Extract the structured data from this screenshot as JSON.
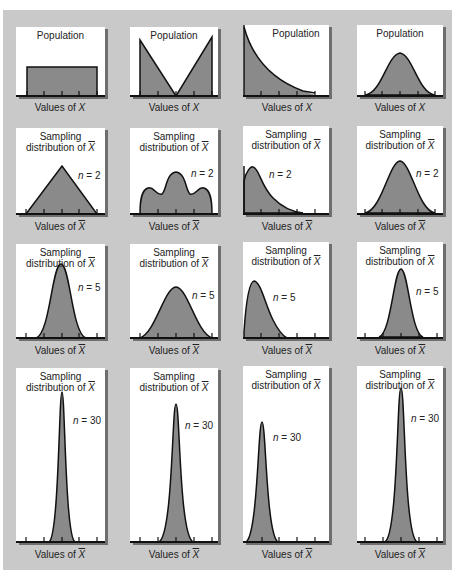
{
  "figure": {
    "columns": [
      "Uniform population",
      "Bimodal (V-shaped) population",
      "Exponential (right-skewed) population",
      "Normal population"
    ],
    "rows": [
      {
        "row": "population",
        "panels": [
          {
            "title": "Population",
            "n_label": "",
            "xlabel_prefix": "Values of ",
            "xlabel_var": "X",
            "shape": "uniform"
          },
          {
            "title": "Population",
            "n_label": "",
            "xlabel_prefix": "Values of ",
            "xlabel_var": "X",
            "shape": "v-shape"
          },
          {
            "title": "Population",
            "n_label": "",
            "xlabel_prefix": "Values of ",
            "xlabel_var": "X",
            "shape": "exponential"
          },
          {
            "title": "Population",
            "n_label": "",
            "xlabel_prefix": "Values of ",
            "xlabel_var": "X",
            "shape": "normal"
          }
        ]
      },
      {
        "row": "n2",
        "panels": [
          {
            "title1": "Sampling",
            "title2": "distribution of ",
            "title_var": "X",
            "n_var": "n",
            "n_val": " = 2",
            "xlabel_prefix": "Values of ",
            "xlabel_var": "X",
            "shape": "triangle"
          },
          {
            "title1": "Sampling",
            "title2": "distribution of ",
            "title_var": "X",
            "n_var": "n",
            "n_val": " = 2",
            "xlabel_prefix": "Values of ",
            "xlabel_var": "X",
            "shape": "trimodal"
          },
          {
            "title1": "Sampling",
            "title2": "distribution of ",
            "title_var": "X",
            "n_var": "n",
            "n_val": " = 2",
            "xlabel_prefix": "Values of ",
            "xlabel_var": "X",
            "shape": "right-skewed"
          },
          {
            "title1": "Sampling",
            "title2": "distribution of ",
            "title_var": "X",
            "n_var": "n",
            "n_val": " = 2",
            "xlabel_prefix": "Values of ",
            "xlabel_var": "X",
            "shape": "normal-narrower"
          }
        ]
      },
      {
        "row": "n5",
        "panels": [
          {
            "title1": "Sampling",
            "title2": "distribution of ",
            "title_var": "X",
            "n_var": "n",
            "n_val": " = 5",
            "xlabel_prefix": "Values of ",
            "xlabel_var": "X",
            "shape": "near-normal"
          },
          {
            "title1": "Sampling",
            "title2": "distribution of ",
            "title_var": "X",
            "n_var": "n",
            "n_val": " = 5",
            "xlabel_prefix": "Values of ",
            "xlabel_var": "X",
            "shape": "near-normal-wide"
          },
          {
            "title1": "Sampling",
            "title2": "distribution of ",
            "title_var": "X",
            "n_var": "n",
            "n_val": " = 5",
            "xlabel_prefix": "Values of ",
            "xlabel_var": "X",
            "shape": "right-skewed-less"
          },
          {
            "title1": "Sampling",
            "title2": "distribution of ",
            "title_var": "X",
            "n_var": "n",
            "n_val": " = 5",
            "xlabel_prefix": "Values of ",
            "xlabel_var": "X",
            "shape": "normal-narrow"
          }
        ]
      },
      {
        "row": "n30",
        "panels": [
          {
            "title1": "Sampling",
            "title2": "distribution of ",
            "title_var": "X",
            "n_var": "n",
            "n_val": " = 30",
            "xlabel_prefix": "Values of ",
            "xlabel_var": "X",
            "shape": "normal-spike"
          },
          {
            "title1": "Sampling",
            "title2": "distribution of ",
            "title_var": "X",
            "n_var": "n",
            "n_val": " = 30",
            "xlabel_prefix": "Values of ",
            "xlabel_var": "X",
            "shape": "normal-spike"
          },
          {
            "title1": "Sampling",
            "title2": "distribution of ",
            "title_var": "X",
            "n_var": "n",
            "n_val": " = 30",
            "xlabel_prefix": "Values of ",
            "xlabel_var": "X",
            "shape": "normal-spike-left"
          },
          {
            "title1": "Sampling",
            "title2": "distribution of ",
            "title_var": "X",
            "n_var": "n",
            "n_val": " = 30",
            "xlabel_prefix": "Values of ",
            "xlabel_var": "X",
            "shape": "normal-spike"
          }
        ]
      }
    ]
  },
  "colors": {
    "background": "#c9c9c9",
    "panel": "#ffffff",
    "fill": "#8a8a8a",
    "stroke": "#111111",
    "shadow": "#6e6e6e"
  }
}
